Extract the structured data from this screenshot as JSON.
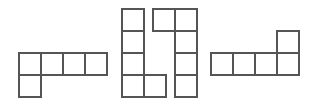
{
  "canvas": {
    "width": 318,
    "height": 111,
    "background_color": "#ffffff",
    "cell_size": 22,
    "stroke_color": "#555555",
    "stroke_width": 1.1
  },
  "figure": {
    "kind": "polyomino-set",
    "shape_count": 4,
    "total_cells": 20
  },
  "shapes": [
    {
      "name": "shape-1-left-L-pentomino",
      "origin_x": 19,
      "origin_y": 53,
      "cell_count": 5,
      "bounding_cols": 4,
      "bounding_rows": 2,
      "cells": [
        {
          "col": 0,
          "row": 0
        },
        {
          "col": 1,
          "row": 0
        },
        {
          "col": 2,
          "row": 0
        },
        {
          "col": 3,
          "row": 0
        },
        {
          "col": 0,
          "row": 1
        }
      ]
    },
    {
      "name": "shape-2-middle-left-L-pentomino",
      "origin_x": 122,
      "origin_y": 9,
      "cell_count": 5,
      "bounding_cols": 2,
      "bounding_rows": 4,
      "cells": [
        {
          "col": 0,
          "row": 0
        },
        {
          "col": 0,
          "row": 1
        },
        {
          "col": 0,
          "row": 2
        },
        {
          "col": 0,
          "row": 3
        },
        {
          "col": 1,
          "row": 3
        }
      ]
    },
    {
      "name": "shape-3-middle-right-J-pentomino",
      "origin_x": 153,
      "origin_y": 9,
      "cell_count": 5,
      "bounding_cols": 2,
      "bounding_rows": 4,
      "cells": [
        {
          "col": 0,
          "row": 0
        },
        {
          "col": 1,
          "row": 0
        },
        {
          "col": 1,
          "row": 1
        },
        {
          "col": 1,
          "row": 2
        },
        {
          "col": 1,
          "row": 3
        }
      ]
    },
    {
      "name": "shape-4-right-J-pentomino",
      "origin_x": 211,
      "origin_y": 31,
      "cell_count": 5,
      "bounding_cols": 4,
      "bounding_rows": 2,
      "cells": [
        {
          "col": 3,
          "row": 0
        },
        {
          "col": 0,
          "row": 1
        },
        {
          "col": 1,
          "row": 1
        },
        {
          "col": 2,
          "row": 1
        },
        {
          "col": 3,
          "row": 1
        }
      ]
    }
  ]
}
